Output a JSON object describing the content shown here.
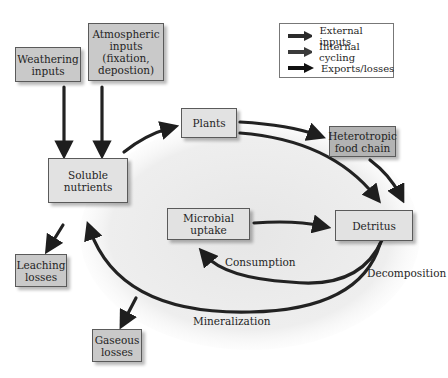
{
  "legend": {
    "items": [
      {
        "label": "External inputs",
        "color": "#2b2b2b"
      },
      {
        "label": "Internal cycling",
        "color": "#3a3a3a"
      },
      {
        "label": "Exports/losses",
        "color": "#111111"
      }
    ]
  },
  "nodes": {
    "weathering": [
      "Weathering",
      "inputs"
    ],
    "atmospheric": [
      "Atmospheric",
      "inputs",
      "(fixation,",
      "depostion)"
    ],
    "soluble": [
      "Soluble",
      "nutrients"
    ],
    "plants": [
      "Plants"
    ],
    "heterotropic": [
      "Heterotropic",
      "food chain"
    ],
    "microbial": [
      "Microbial",
      "uptake"
    ],
    "detritus": [
      "Detritus"
    ],
    "leaching": [
      "Leaching",
      "losses"
    ],
    "gaseous": [
      "Gaseous",
      "losses"
    ]
  },
  "labels": {
    "consumption": "Consumption",
    "decomposition": "Decomposition",
    "mineralization": "Mineralization"
  },
  "colors": {
    "arrow": "#2a2a2a",
    "ellipse": "#ececec",
    "box_input": "#c9c9c9",
    "box_internal": "#e2e2e2",
    "box_heterotropic": "#b3b3b3"
  }
}
